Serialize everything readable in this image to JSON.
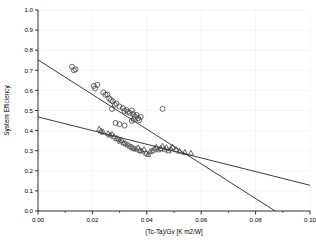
{
  "chart_data": {
    "type": "scatter",
    "title": "",
    "xlabel": "(Tc-Ta)/Gv [K m2/W]",
    "ylabel": "System Efficiency",
    "xlim": [
      0.0,
      0.1
    ],
    "ylim": [
      0.0,
      1.0
    ],
    "xticks": [
      0.0,
      0.02,
      0.04,
      0.06,
      0.08,
      0.1
    ],
    "xtick_labels": [
      "0.00",
      "0.02",
      "0.04",
      "0.06",
      "0.08",
      "0.10"
    ],
    "x_minor_ticks": [
      0.01,
      0.03,
      0.05,
      0.07,
      0.09
    ],
    "yticks": [
      0.0,
      0.1,
      0.2,
      0.3,
      0.4,
      0.5,
      0.6,
      0.7,
      0.8,
      0.9,
      1.0
    ],
    "ytick_labels": [
      "0.0",
      "0.1",
      "0.2",
      "0.3",
      "0.4",
      "0.5",
      "0.6",
      "0.7",
      "0.8",
      "0.9",
      "1.0"
    ],
    "grid": "faint-vertical-and-horizontal",
    "legend": "none",
    "series": [
      {
        "name": "circles",
        "marker": "open-circle",
        "color": "#3a3a3a",
        "points": [
          [
            0.0125,
            0.718
          ],
          [
            0.0132,
            0.7
          ],
          [
            0.0138,
            0.705
          ],
          [
            0.0205,
            0.622
          ],
          [
            0.021,
            0.61
          ],
          [
            0.0218,
            0.628
          ],
          [
            0.024,
            0.59
          ],
          [
            0.0248,
            0.578
          ],
          [
            0.0255,
            0.58
          ],
          [
            0.0262,
            0.56
          ],
          [
            0.0268,
            0.552
          ],
          [
            0.0275,
            0.545
          ],
          [
            0.0282,
            0.528
          ],
          [
            0.0288,
            0.535
          ],
          [
            0.0272,
            0.508
          ],
          [
            0.03,
            0.52
          ],
          [
            0.0312,
            0.512
          ],
          [
            0.0318,
            0.498
          ],
          [
            0.0325,
            0.503
          ],
          [
            0.033,
            0.492
          ],
          [
            0.0338,
            0.488
          ],
          [
            0.0345,
            0.5
          ],
          [
            0.035,
            0.482
          ],
          [
            0.0356,
            0.47
          ],
          [
            0.0362,
            0.478
          ],
          [
            0.0368,
            0.462
          ],
          [
            0.0352,
            0.455
          ],
          [
            0.0345,
            0.448
          ],
          [
            0.0372,
            0.452
          ],
          [
            0.0378,
            0.468
          ],
          [
            0.03,
            0.432
          ],
          [
            0.0318,
            0.425
          ],
          [
            0.0285,
            0.438
          ],
          [
            0.0458,
            0.508
          ]
        ]
      },
      {
        "name": "triangles",
        "marker": "open-triangle",
        "color": "#3a3a3a",
        "points": [
          [
            0.0225,
            0.408
          ],
          [
            0.0232,
            0.398
          ],
          [
            0.024,
            0.392
          ],
          [
            0.0258,
            0.385
          ],
          [
            0.0265,
            0.378
          ],
          [
            0.0272,
            0.382
          ],
          [
            0.028,
            0.37
          ],
          [
            0.0288,
            0.362
          ],
          [
            0.0295,
            0.358
          ],
          [
            0.0302,
            0.348
          ],
          [
            0.0308,
            0.352
          ],
          [
            0.0315,
            0.34
          ],
          [
            0.0322,
            0.335
          ],
          [
            0.033,
            0.33
          ],
          [
            0.0338,
            0.322
          ],
          [
            0.0345,
            0.318
          ],
          [
            0.0352,
            0.312
          ],
          [
            0.036,
            0.308
          ],
          [
            0.0368,
            0.315
          ],
          [
            0.0375,
            0.302
          ],
          [
            0.0382,
            0.298
          ],
          [
            0.039,
            0.306
          ],
          [
            0.0398,
            0.288
          ],
          [
            0.0405,
            0.282
          ],
          [
            0.0412,
            0.295
          ],
          [
            0.042,
            0.3
          ],
          [
            0.0428,
            0.31
          ],
          [
            0.0435,
            0.318
          ],
          [
            0.0442,
            0.305
          ],
          [
            0.045,
            0.312
          ],
          [
            0.0458,
            0.322
          ],
          [
            0.0465,
            0.308
          ],
          [
            0.0472,
            0.315
          ],
          [
            0.048,
            0.3
          ],
          [
            0.0488,
            0.31
          ],
          [
            0.0495,
            0.318
          ],
          [
            0.0508,
            0.305
          ],
          [
            0.052,
            0.298
          ],
          [
            0.054,
            0.292
          ],
          [
            0.0562,
            0.288
          ]
        ]
      }
    ],
    "fit_lines": [
      {
        "name": "steep-fit",
        "x0": 0.0,
        "y0": 0.752,
        "x1": 0.0872,
        "y1": 0.0,
        "color": "#1a1a1a"
      },
      {
        "name": "shallow-fit",
        "x0": 0.0,
        "y0": 0.468,
        "x1": 0.1,
        "y1": 0.128,
        "color": "#1a1a1a"
      }
    ]
  }
}
